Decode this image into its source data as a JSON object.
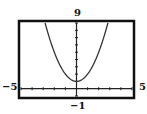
{
  "chart_data": {
    "type": "line",
    "title": "",
    "function": "y = x^2 + 1",
    "series": [
      {
        "name": "y = x^2 + 1",
        "x": [
          -2.83,
          -2.5,
          -2,
          -1.5,
          -1,
          -0.5,
          0,
          0.5,
          1,
          1.5,
          2,
          2.5,
          2.83
        ],
        "values": [
          9,
          7.25,
          5,
          3.25,
          2,
          1.25,
          1,
          1.25,
          2,
          3.25,
          5,
          7.25,
          9
        ]
      }
    ],
    "xlim": [
      -5,
      5
    ],
    "ylim": [
      -1,
      9
    ],
    "xscale": 1,
    "yscale": 1,
    "grid": false,
    "xlabel": "",
    "ylabel": ""
  },
  "labels": {
    "ymax": "9",
    "ymin": "−1",
    "xmin": "−5",
    "xmax": "5"
  },
  "colors": {
    "frame": "#111111",
    "curve": "#333333"
  }
}
